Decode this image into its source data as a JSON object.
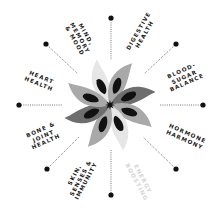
{
  "diagram": {
    "type": "radial-benefits-wheel",
    "center": {
      "x": 110,
      "y": 105
    },
    "colors": {
      "background": "#ffffff",
      "text": "#1a1a1a",
      "faded_text": "#d4d4d4",
      "dot": "#111111",
      "dotted_line": "#555555",
      "petal_light": "#e6e6e6",
      "petal_mid": "#a9a9a9",
      "petal_dark": "#6e6e6e",
      "petal_spot": "#111111"
    },
    "labels": [
      {
        "id": "mind",
        "text": "MIND,\nMEMORY\n& MOOD",
        "x": 80,
        "y": 38,
        "rotate": 60,
        "faded": false
      },
      {
        "id": "digestive",
        "text": "DIGESTIVE\nHEALTH",
        "x": 141,
        "y": 32,
        "rotate": -60,
        "faded": false
      },
      {
        "id": "blood-sugar",
        "text": "BLOOD-\nSUGAR\nBALANCE",
        "x": 184,
        "y": 77,
        "rotate": -24,
        "faded": false
      },
      {
        "id": "hormone",
        "text": "HORMONE\nHARMONY",
        "x": 186,
        "y": 136,
        "rotate": 24,
        "faded": false
      },
      {
        "id": "energy",
        "text": "ENERGY\nBOOSTING",
        "x": 140,
        "y": 180,
        "rotate": 62,
        "faded": true
      },
      {
        "id": "skin",
        "text": "SKIN,\nSENSES &\nIMMUNITY",
        "x": 80,
        "y": 178,
        "rotate": -62,
        "faded": false
      },
      {
        "id": "bone",
        "text": "BONE &\nJOINT\nHEALTH",
        "x": 43,
        "y": 136,
        "rotate": -24,
        "faded": false
      },
      {
        "id": "heart",
        "text": "HEART\nHEALTH",
        "x": 40,
        "y": 80,
        "rotate": 22,
        "faded": false
      }
    ],
    "spokes": [
      {
        "dir": "top",
        "dot": {
          "x": 111,
          "y": 18
        },
        "line_end": {
          "x": 111,
          "y": 60
        }
      },
      {
        "dir": "top-right",
        "dot": {
          "x": 176,
          "y": 44
        },
        "line_end": {
          "x": 144,
          "y": 74
        }
      },
      {
        "dir": "right",
        "dot": {
          "x": 203,
          "y": 105
        },
        "line_end": {
          "x": 160,
          "y": 105
        }
      },
      {
        "dir": "bottom-right",
        "dot": {
          "x": 176,
          "y": 169
        },
        "line_end": {
          "x": 143,
          "y": 137
        }
      },
      {
        "dir": "bottom",
        "dot": {
          "x": 111,
          "y": 195
        },
        "line_end": {
          "x": 111,
          "y": 150
        }
      },
      {
        "dir": "bottom-left",
        "dot": {
          "x": 47,
          "y": 169
        },
        "line_end": {
          "x": 79,
          "y": 137
        }
      },
      {
        "dir": "left",
        "dot": {
          "x": 19,
          "y": 105
        },
        "line_end": {
          "x": 62,
          "y": 105
        }
      },
      {
        "dir": "top-left",
        "dot": {
          "x": 46,
          "y": 44
        },
        "line_end": {
          "x": 78,
          "y": 74
        }
      }
    ],
    "petals": [
      {
        "angle": -22,
        "tone": "petal_light"
      },
      {
        "angle": 22,
        "tone": "petal_mid"
      },
      {
        "angle": 68,
        "tone": "petal_dark"
      },
      {
        "angle": 112,
        "tone": "petal_mid"
      },
      {
        "angle": 158,
        "tone": "petal_light"
      },
      {
        "angle": 202,
        "tone": "petal_mid"
      },
      {
        "angle": 248,
        "tone": "petal_dark"
      },
      {
        "angle": 292,
        "tone": "petal_mid"
      }
    ]
  }
}
